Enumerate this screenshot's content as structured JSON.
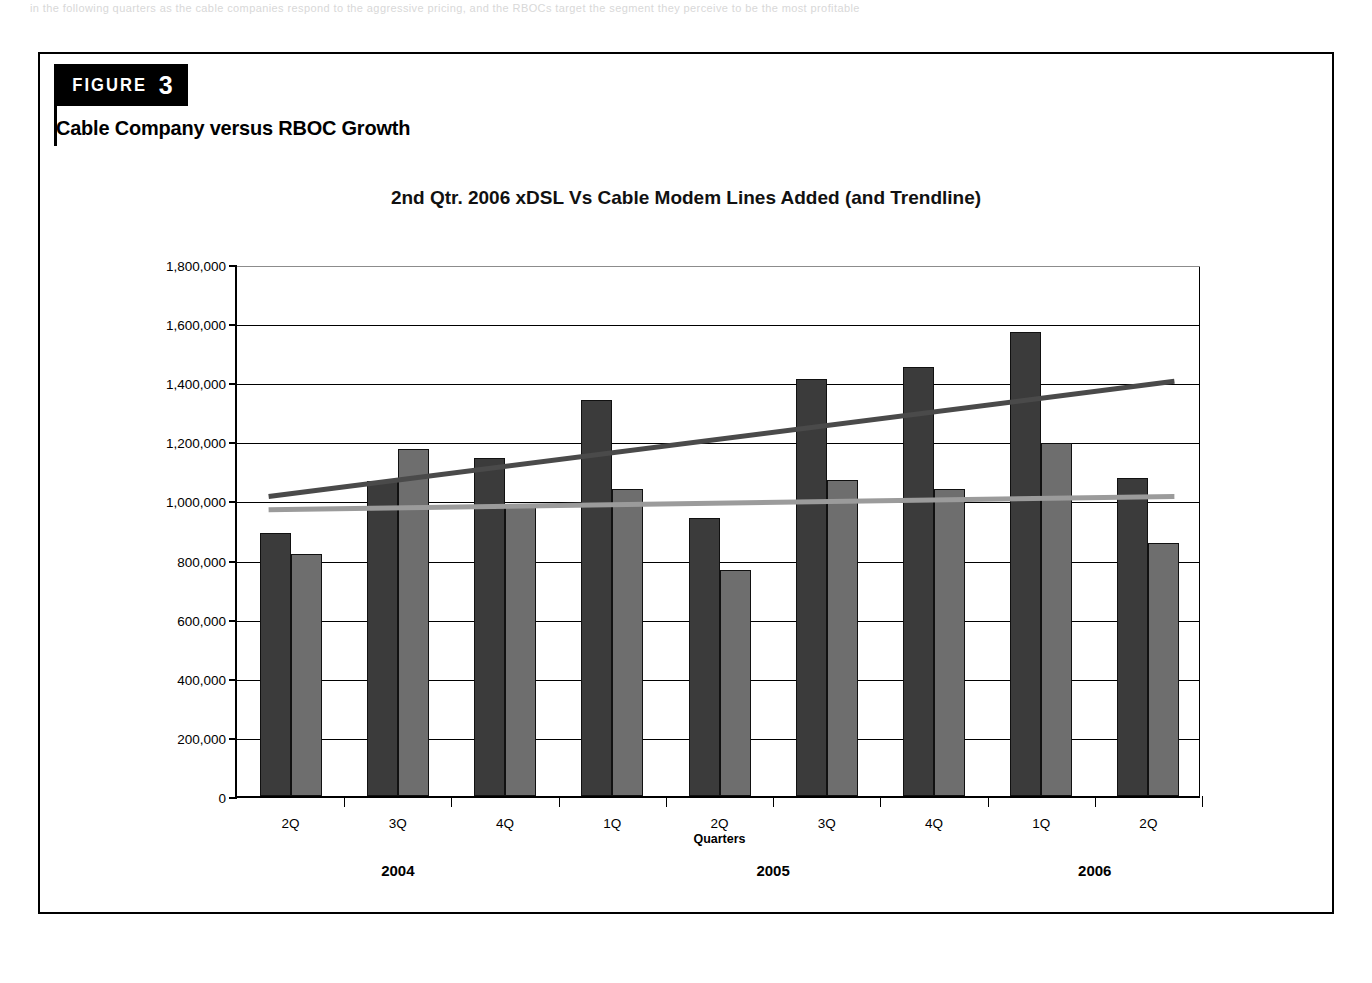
{
  "page": {
    "top_faint_text": "in the following quarters as the cable companies respond to the aggressive pricing, and the RBOCs target the segment they perceive to be the most profitable"
  },
  "figure": {
    "badge_word": "FIGURE",
    "badge_number": "3",
    "subtitle": "Cable Company versus RBOC Growth"
  },
  "chart_data": {
    "type": "bar",
    "title": "2nd Qtr.  2006 xDSL Vs Cable Modem Lines Added (and Trendline)",
    "xlabel": "Quarters",
    "ylabel": "",
    "ylim": [
      0,
      1800000
    ],
    "ytick_step": 200000,
    "grid": true,
    "legend_position": "none",
    "categories": [
      "2Q",
      "3Q",
      "4Q",
      "1Q",
      "2Q",
      "3Q",
      "4Q",
      "1Q",
      "2Q"
    ],
    "year_groups": [
      {
        "label": "2004",
        "start_index": 0,
        "end_index": 2
      },
      {
        "label": "2005",
        "start_index": 3,
        "end_index": 6
      },
      {
        "label": "2006",
        "start_index": 7,
        "end_index": 8
      }
    ],
    "ytick_labels": [
      "1,800,000",
      "1,600,000",
      "1,400,000",
      "1,200,000",
      "1,000,000",
      "800,000",
      "600,000",
      "400,000",
      "200,000",
      "0"
    ],
    "ytick_values": [
      1800000,
      1600000,
      1400000,
      1200000,
      1000000,
      800000,
      600000,
      400000,
      200000,
      0
    ],
    "series": [
      {
        "name": "xDSL Lines Added",
        "color": "#3b3b3b",
        "values": [
          890000,
          1065000,
          1145000,
          1340000,
          940000,
          1410000,
          1450000,
          1570000,
          1075000
        ]
      },
      {
        "name": "Cable Modem Lines Added",
        "color": "#6e6e6e",
        "values": [
          820000,
          1175000,
          980000,
          1040000,
          765000,
          1070000,
          1040000,
          1195000,
          855000
        ]
      }
    ],
    "trendlines": [
      {
        "name": "xDSL Trendline",
        "color": "#4a4a4a",
        "start": {
          "category_index": 0,
          "value": 1020000
        },
        "end": {
          "category_index": 8,
          "value": 1410000
        }
      },
      {
        "name": "Cable Modem Trendline",
        "color": "#9b9b9b",
        "start": {
          "category_index": 0,
          "value": 975000
        },
        "end": {
          "category_index": 8,
          "value": 1020000
        }
      }
    ]
  }
}
